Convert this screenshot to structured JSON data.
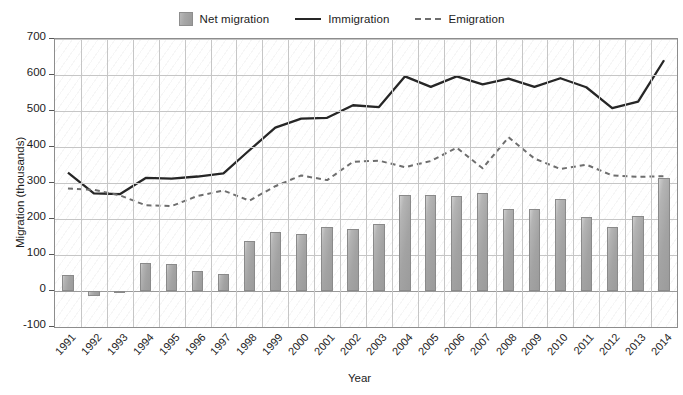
{
  "legend": {
    "position": "top-center",
    "items": [
      {
        "label": "Net migration",
        "marker": "bar-swatch-icon",
        "color": "#a8a8a8"
      },
      {
        "label": "Immigration",
        "marker": "solid-line-icon",
        "color": "#262626"
      },
      {
        "label": "Emigration",
        "marker": "dashed-line-icon",
        "color": "#6e6e6e"
      }
    ]
  },
  "chart_data": {
    "type": "bar",
    "title": "",
    "xlabel": "Year",
    "ylabel": "Migration (thousands)",
    "ylim": [
      -100,
      700
    ],
    "yticks": [
      -100,
      0,
      100,
      200,
      300,
      400,
      500,
      600,
      700
    ],
    "grid": true,
    "legend_position": "top-center",
    "categories": [
      "1991",
      "1992",
      "1993",
      "1994",
      "1995",
      "1996",
      "1997",
      "1998",
      "1999",
      "2000",
      "2001",
      "2002",
      "2003",
      "2004",
      "2005",
      "2006",
      "2007",
      "2008",
      "2009",
      "2010",
      "2011",
      "2012",
      "2013",
      "2014"
    ],
    "series": [
      {
        "name": "Net migration",
        "type": "bar",
        "color": "#a8a8a8",
        "values": [
          45,
          -13,
          -1,
          77,
          76,
          55,
          48,
          140,
          163,
          158,
          179,
          172,
          185,
          268,
          267,
          265,
          273,
          229,
          229,
          256,
          205,
          177,
          209,
          313
        ]
      },
      {
        "name": "Immigration",
        "type": "line",
        "style": "solid",
        "color": "#262626",
        "values": [
          329,
          271,
          269,
          314,
          312,
          318,
          327,
          391,
          454,
          479,
          481,
          516,
          511,
          596,
          567,
          596,
          574,
          590,
          567,
          591,
          566,
          508,
          526,
          641
        ]
      },
      {
        "name": "Emigration",
        "type": "line",
        "style": "dashed",
        "color": "#6e6e6e",
        "values": [
          285,
          281,
          266,
          238,
          236,
          264,
          279,
          251,
          291,
          321,
          308,
          359,
          362,
          344,
          361,
          398,
          341,
          427,
          368,
          339,
          351,
          321,
          317,
          319
        ]
      }
    ]
  }
}
